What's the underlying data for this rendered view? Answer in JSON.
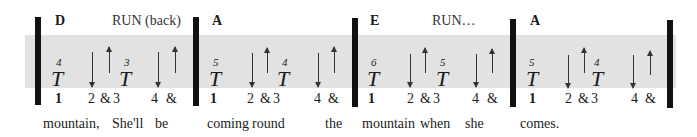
{
  "measures": [
    {
      "chord": "D",
      "strum_label": "RUN (back)",
      "thumb1_finger": "4",
      "thumb1": "T",
      "thumb2_finger": "3",
      "thumb2": "T",
      "counts": [
        "1",
        "2",
        "&",
        "3",
        "4",
        "&"
      ],
      "lyrics": [
        "mountain,",
        "She'll",
        "be"
      ]
    },
    {
      "chord": "A",
      "strum_label": "",
      "thumb1_finger": "5",
      "thumb1": "T",
      "thumb2_finger": "4",
      "thumb2": "T",
      "counts": [
        "1",
        "2",
        "&",
        "3",
        "4",
        "&"
      ],
      "lyrics": [
        "coming",
        "round",
        "the"
      ]
    },
    {
      "chord": "E",
      "strum_label": "RUN…",
      "thumb1_finger": "6",
      "thumb1": "T",
      "thumb2_finger": "5",
      "thumb2": "T",
      "counts": [
        "1",
        "2",
        "&",
        "3",
        "4",
        "&"
      ],
      "lyrics": [
        "mountain",
        "when",
        "she"
      ]
    },
    {
      "chord": "A",
      "strum_label": "",
      "thumb1_finger": "5",
      "thumb1": "T",
      "thumb2_finger": "4",
      "thumb2": "T",
      "counts": [
        "1",
        "2",
        "&",
        "3",
        "4",
        "&"
      ],
      "lyrics": [
        "comes."
      ]
    }
  ],
  "strum_pattern": [
    "thumb",
    "down",
    "up",
    "thumb",
    "down",
    "up"
  ],
  "colors": {
    "band": "#e2e2e2",
    "bar": "#111111",
    "arrow": "#333333"
  }
}
